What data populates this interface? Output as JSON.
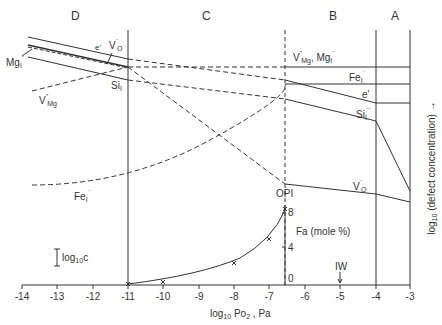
{
  "regions": [
    {
      "id": "D",
      "label": "D"
    },
    {
      "id": "C",
      "label": "C"
    },
    {
      "id": "B",
      "label": "B"
    },
    {
      "id": "A",
      "label": "A"
    }
  ],
  "x_axis": {
    "title_prefix": "log",
    "title_sub": "10",
    "title_mid": " Po",
    "title_sub2": "2",
    "title_suffix": " , Pa",
    "ticks": [
      "-14",
      "-13",
      "-12",
      "-11",
      "-10",
      "-9",
      "-8",
      "-7",
      "-6",
      "-5",
      "-4",
      "-3"
    ]
  },
  "y_axis": {
    "title_prefix": "log",
    "title_sub": "10",
    "title_suffix": "   (defect concentration)  →"
  },
  "inset": {
    "title": "Fa (mole %)",
    "ticks": [
      "0",
      "4",
      "8"
    ],
    "points_log_po2": [
      -11,
      -10,
      -8,
      -7,
      -6.6
    ]
  },
  "labels": {
    "e_prime_left": "e'",
    "vo_left": "V",
    "vo_left_sub": "O",
    "vo_left_sup": "¨",
    "mg_left": "Mg",
    "mg_left_sub": "I",
    "mg_left_sup": "¨",
    "si_left": "Si",
    "si_left_sub": "I",
    "si_left_sup": "¨",
    "vmg_left": "V",
    "vmg_left_sub": "Mg",
    "vmg_left_sup": "\"",
    "fe_left": "Fe",
    "fe_left_sub": "I",
    "fe_left_sup": "¨",
    "vmg_mg_right": "V",
    "vmg_mg_right_sub": "Mg",
    "vmg_mg_right_sup": "\"",
    "vmg_mg_right_mid": ", Mg",
    "vmg_mg_right_sub2": "I",
    "vmg_mg_right_sup2": "¨",
    "fe_right": "Fe",
    "fe_right_sub": "I",
    "fe_right_sup": "¨",
    "e_prime_right": "e'",
    "si_right": "Si",
    "si_right_sub": "I",
    "si_right_sup": "¨¨",
    "vo_right": "V",
    "vo_right_sub": "O",
    "vo_right_sup": "¨",
    "opi": "OPI",
    "iw": "IW",
    "scale_prefix": "log",
    "scale_sub": "10",
    "scale_suffix": "c"
  }
}
